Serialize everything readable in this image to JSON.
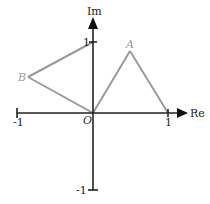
{
  "diagram": {
    "title": "",
    "type": "complex-plane",
    "axes": {
      "real_label": "Re",
      "imag_label": "Im",
      "origin_label": "O",
      "ticks": {
        "re_neg": "-1",
        "re_pos": "1",
        "im_pos": "1",
        "im_neg": "-1"
      }
    },
    "points": [
      {
        "name": "A",
        "label": "A"
      },
      {
        "name": "B",
        "label": "B"
      }
    ],
    "colors": {
      "axis": "#222222",
      "segment": "#999999",
      "point_label": "#999999"
    }
  }
}
